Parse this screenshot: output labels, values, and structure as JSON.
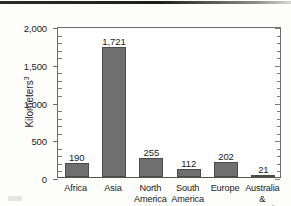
{
  "figure": {
    "yaxis_title_main": "Kilometers",
    "yaxis_title_sup": "3"
  },
  "chart_data": {
    "type": "bar",
    "title": "",
    "xlabel": "",
    "ylabel": "Kilometers3",
    "categories": [
      "Africa",
      "Asia",
      "North\nAmerica",
      "South\nAmerica",
      "Europe",
      "Australia\n& Oceania"
    ],
    "values": [
      190,
      1721,
      255,
      112,
      202,
      21
    ],
    "value_labels": [
      "190",
      "1,721",
      "255",
      "112",
      "202",
      "21"
    ],
    "ylim": [
      0,
      2000
    ],
    "ytick_values": [
      0,
      500,
      1000,
      1500,
      2000
    ],
    "ytick_labels": [
      "0",
      "500",
      "1,000",
      "1,500",
      "2,000"
    ],
    "yminor_step": 100,
    "grid": false,
    "legend": "none",
    "bar_color": "#6f6f6f",
    "bar_edge_color": "#4b4b4b",
    "axis_color": "#6d6d6d"
  }
}
